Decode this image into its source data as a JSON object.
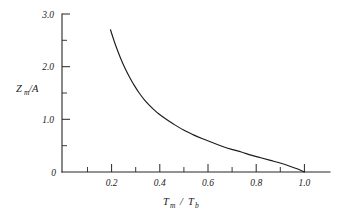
{
  "chart_data": {
    "type": "line",
    "title": "",
    "subtitle": "",
    "xlabel": "Tm / Tb",
    "ylabel": "Zm/A",
    "xlabel_parts": {
      "main1": "T",
      "sub1": "m",
      "slash": "/",
      "main2": "T",
      "sub2": "b"
    },
    "ylabel_parts": {
      "main1": "Z",
      "sub1": "m",
      "rest": "/A"
    },
    "xlim": [
      0.0,
      1.08
    ],
    "ylim": [
      0.0,
      3.0
    ],
    "grid": false,
    "legend": "none",
    "x_ticks_major": [
      0.2,
      0.4,
      0.6,
      0.8,
      1.0
    ],
    "x_tick_labels": [
      "0.2",
      "0.4",
      "0.6",
      "0.8",
      "1.0"
    ],
    "x_ticks_minor": [
      0.1,
      0.3,
      0.5,
      0.7,
      0.9
    ],
    "y_ticks_major": [
      0,
      1.0,
      2.0,
      3.0
    ],
    "y_tick_labels": [
      "0",
      "1.0",
      "2.0",
      "3.0"
    ],
    "y_ticks_minor": [
      0.5,
      1.5,
      2.5
    ],
    "series": [
      {
        "name": "Zm/A vs Tm/Tb",
        "x": [
          0.2,
          0.22,
          0.24,
          0.26,
          0.28,
          0.3,
          0.32,
          0.34,
          0.36,
          0.38,
          0.4,
          0.43,
          0.46,
          0.5,
          0.54,
          0.58,
          0.62,
          0.66,
          0.7,
          0.74,
          0.78,
          0.82,
          0.86,
          0.9,
          0.94,
          0.97,
          1.0
        ],
        "y": [
          2.7,
          2.42,
          2.18,
          1.97,
          1.79,
          1.63,
          1.49,
          1.37,
          1.27,
          1.18,
          1.1,
          1.0,
          0.91,
          0.8,
          0.71,
          0.63,
          0.56,
          0.49,
          0.43,
          0.38,
          0.32,
          0.27,
          0.22,
          0.17,
          0.11,
          0.06,
          0.0
        ]
      }
    ],
    "curve_start": {
      "x": 0.2,
      "y": 2.7
    },
    "curve_end": {
      "x": 1.0,
      "y": 0.0
    },
    "colors": {
      "curve": "#1c1c1c",
      "axis": "#262626",
      "background": "#ffffff"
    }
  },
  "axes_geometry": {
    "origin_px": {
      "x": 62,
      "y": 172
    },
    "x_axis_right_px": 330,
    "y_axis_top_px": 14
  }
}
